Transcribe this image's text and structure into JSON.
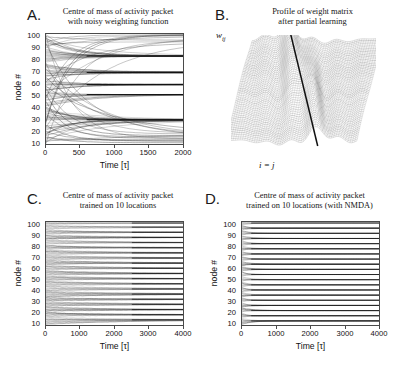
{
  "figure": {
    "panels": [
      {
        "id": "A",
        "letter": "A.",
        "title": "Centre of mass of activity packet\nwith noisy weighting function",
        "xlabel": "Time [τ]",
        "ylabel": "node #",
        "xticks": [
          "0",
          "500",
          "1000",
          "1500",
          "2000"
        ],
        "yticks": [
          "10",
          "20",
          "30",
          "40",
          "50",
          "60",
          "70",
          "80",
          "90",
          "100"
        ]
      },
      {
        "id": "B",
        "letter": "B.",
        "title": "Profile of weight matrix\nafter partial learning",
        "ylabel": "w",
        "ylabel_sub": "ij",
        "diag_label": "i = j"
      },
      {
        "id": "C",
        "letter": "C.",
        "title": "Centre of mass of activity packet\ntrained on 10 locations",
        "xlabel": "Time [τ]",
        "ylabel": "node #",
        "xticks": [
          "0",
          "1000",
          "2000",
          "3000",
          "4000"
        ],
        "yticks": [
          "10",
          "20",
          "30",
          "40",
          "50",
          "60",
          "70",
          "80",
          "90",
          "100"
        ]
      },
      {
        "id": "D",
        "letter": "D.",
        "title": "Centre of mass of activity packet\ntrained on 10 locations (with NMDA)",
        "xlabel": "Time [τ]",
        "ylabel": "node #",
        "xticks": [
          "0",
          "1000",
          "2000",
          "3000",
          "4000"
        ],
        "yticks": [
          "10",
          "20",
          "30",
          "40",
          "50",
          "60",
          "70",
          "80",
          "90",
          "100"
        ]
      }
    ]
  },
  "chart_data": [
    {
      "type": "line",
      "panel": "A",
      "title": "Centre of mass of activity packet with noisy weighting function",
      "xlabel": "Time [τ]",
      "ylabel": "node #",
      "xlim": [
        0,
        2000
      ],
      "ylim": [
        0,
        100
      ],
      "xticks": [
        0,
        500,
        1000,
        1500,
        2000
      ],
      "yticks": [
        10,
        20,
        30,
        40,
        50,
        60,
        70,
        80,
        90,
        100
      ],
      "grid": false,
      "legend": "none",
      "description": "100 trajectories of activity-packet centre of mass starting from evenly spaced initial node positions; they drift and bundle onto a small number of attractor nodes.",
      "attractors": [
        80,
        65,
        54,
        45,
        22
      ],
      "n_trajectories": 100
    },
    {
      "type": "area",
      "panel": "B",
      "title": "Profile of weight matrix after partial learning",
      "ylabel": "w_ij",
      "annotation": "i = j",
      "description": "Waterfall / mesh surface of the recurrent weight matrix rows after partial learning; peaks sit on the i = j diagonal at the trained locations.",
      "n_rows": 60,
      "peaks_on_diagonal": 6
    },
    {
      "type": "line",
      "panel": "C",
      "title": "Centre of mass of activity packet trained on 10 locations",
      "xlabel": "Time [τ]",
      "ylabel": "node #",
      "xlim": [
        0,
        4000
      ],
      "ylim": [
        0,
        100
      ],
      "xticks": [
        0,
        1000,
        2000,
        3000,
        4000
      ],
      "yticks": [
        10,
        20,
        30,
        40,
        50,
        60,
        70,
        80,
        90,
        100
      ],
      "grid": false,
      "legend": "none",
      "description": "Trajectories converge onto about 20 stable attractor nodes within roughly 1500-2000 tau.",
      "attractors": [
        5,
        10,
        15,
        20,
        25,
        30,
        35,
        40,
        45,
        50,
        55,
        60,
        65,
        70,
        75,
        80,
        85,
        90,
        95,
        99
      ],
      "convergence_time": 1800,
      "n_trajectories": 100
    },
    {
      "type": "line",
      "panel": "D",
      "title": "Centre of mass of activity packet trained on 10 locations (with NMDA)",
      "xlabel": "Time [τ]",
      "ylabel": "node #",
      "xlim": [
        0,
        4000
      ],
      "ylim": [
        0,
        100
      ],
      "xticks": [
        0,
        1000,
        2000,
        3000,
        4000
      ],
      "yticks": [
        10,
        20,
        30,
        40,
        50,
        60,
        70,
        80,
        90,
        100
      ],
      "grid": false,
      "legend": "none",
      "description": "With NMDA the trajectories lock onto the attractor nodes almost immediately (within roughly 200 tau) producing near-horizontal dense bands.",
      "attractors": [
        4,
        9,
        14,
        19,
        24,
        29,
        34,
        39,
        44,
        49,
        54,
        59,
        64,
        69,
        74,
        79,
        84,
        89,
        94,
        99
      ],
      "convergence_time": 200,
      "n_trajectories": 100
    }
  ]
}
